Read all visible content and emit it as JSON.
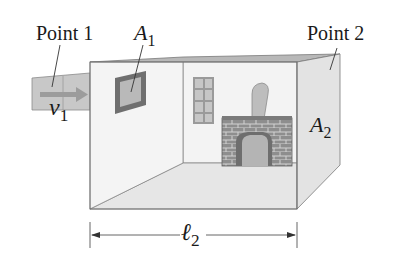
{
  "diagram": {
    "labels": {
      "point1": "Point 1",
      "point2": "Point 2",
      "a1_main": "A",
      "a1_sub": "1",
      "a2_main": "A",
      "a2_sub": "2",
      "v1_main": "v",
      "v1_sub": "1",
      "l2_main": "ℓ",
      "l2_sub": "2"
    },
    "elements": [
      "inlet-duct",
      "velocity-arrow",
      "room-box",
      "window-a1",
      "back-window",
      "fireplace",
      "chimney-pipe",
      "side-wall-a2",
      "length-dimension-l2"
    ],
    "colors": {
      "duct": "#c9c9c9",
      "wall": "#f2f2f2",
      "top_strip": "#b5b5b5",
      "side_wall": "#e4e4e4",
      "floor": "#e8e8e8",
      "brick": "#8c8c8c",
      "line": "#555555"
    }
  }
}
